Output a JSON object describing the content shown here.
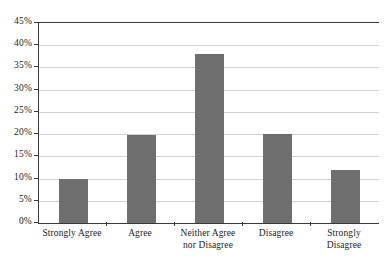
{
  "chart_data": {
    "type": "bar",
    "title": "",
    "subtitle": "",
    "xlabel": "",
    "ylabel": "",
    "categories": [
      "Strongly Agree",
      "Agree",
      "Neither Agree nor Disagree",
      "Disagree",
      "Strongly Disagree"
    ],
    "category_lines": [
      [
        "Strongly Agree"
      ],
      [
        "Agree"
      ],
      [
        "Neither Agree",
        "nor Disagree"
      ],
      [
        "Disagree"
      ],
      [
        "Strongly",
        "Disagree"
      ]
    ],
    "values": [
      10,
      19.8,
      38,
      20,
      12
    ],
    "value_labels": [
      "10%",
      "20%",
      "38%",
      "20%",
      "12%"
    ],
    "ylim": [
      0,
      45
    ],
    "ytick_values": [
      0,
      5,
      10,
      15,
      20,
      25,
      30,
      35,
      40,
      45
    ],
    "ytick_labels": [
      "0%",
      "5%",
      "10%",
      "15%",
      "20%",
      "25%",
      "30%",
      "35%",
      "40%",
      "45%"
    ],
    "grid": true,
    "grid_axis": "y",
    "legend": false,
    "legend_position": "none",
    "bar_color": "#6e6e6e",
    "grid_color": "#d2d2d2",
    "axis_color": "#3a3a3a",
    "background_color": "#ffffff",
    "text_color": "#1c1c1c"
  }
}
